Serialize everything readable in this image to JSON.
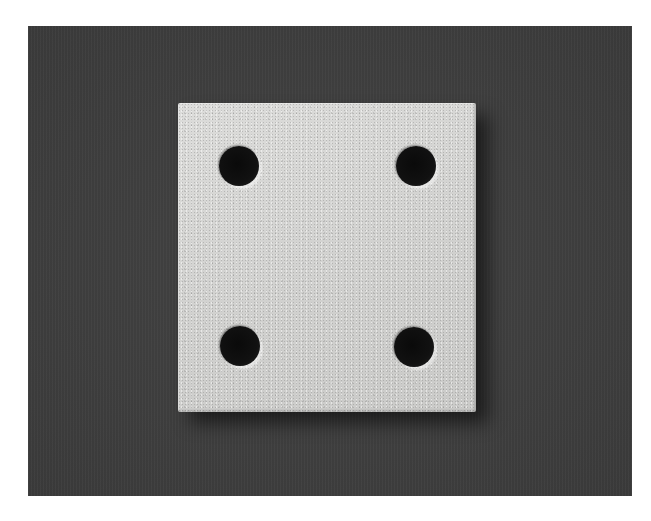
{
  "scene": {
    "subject": "porous ceramic square plate with four through-holes",
    "background_color": "#3f3f3f",
    "border_color": "#ffffff",
    "plate_color": "#d4d4d2",
    "hole_color": "#0a0a0a",
    "hole_count": 4
  }
}
